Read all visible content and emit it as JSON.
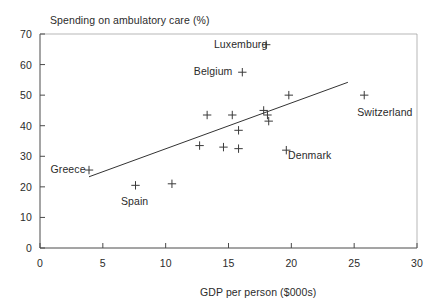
{
  "chart_data": {
    "type": "scatter",
    "title": "",
    "ylabel": "Spending on ambulatory care (%)",
    "xlabel": "GDP per person ($000s)",
    "xlim": [
      0,
      30
    ],
    "ylim": [
      0,
      70
    ],
    "xticks": [
      "0",
      "5",
      "10",
      "15",
      "20",
      "25",
      "30"
    ],
    "yticks": [
      "0",
      "10",
      "20",
      "30",
      "40",
      "50",
      "60",
      "70"
    ],
    "grid": false,
    "legend": "none",
    "marker": "plus",
    "points": [
      {
        "label": "Luxemburg",
        "x": 18.0,
        "y": 66.5
      },
      {
        "label": "Belgium",
        "x": 16.1,
        "y": 57.5
      },
      {
        "label": "",
        "x": 13.3,
        "y": 43.5
      },
      {
        "label": "",
        "x": 15.3,
        "y": 43.5
      },
      {
        "label": "",
        "x": 17.8,
        "y": 45.0
      },
      {
        "label": "",
        "x": 19.8,
        "y": 50.0
      },
      {
        "label": "Switzerland",
        "x": 25.8,
        "y": 50.0
      },
      {
        "label": "",
        "x": 18.1,
        "y": 43.5
      },
      {
        "label": "",
        "x": 18.2,
        "y": 41.5
      },
      {
        "label": "",
        "x": 15.8,
        "y": 38.5
      },
      {
        "label": "",
        "x": 12.7,
        "y": 33.5
      },
      {
        "label": "",
        "x": 14.6,
        "y": 33.0
      },
      {
        "label": "",
        "x": 15.8,
        "y": 32.5
      },
      {
        "label": "Denmark",
        "x": 19.6,
        "y": 32.0
      },
      {
        "label": "Greece",
        "x": 3.9,
        "y": 25.5
      },
      {
        "label": "",
        "x": 7.6,
        "y": 20.5
      },
      {
        "label": "",
        "x": 10.5,
        "y": 21.0
      }
    ],
    "trend_line": {
      "x0": 3.9,
      "y0": 23.3,
      "x1": 24.5,
      "y1": 54.2
    },
    "annotations": [
      {
        "name": "luxemburg",
        "text": "Luxemburg",
        "x": 14.0,
        "y": 66.5
      },
      {
        "name": "belgium",
        "text": "Belgium",
        "x": 12.4,
        "y": 57.5
      },
      {
        "name": "switzerland",
        "text": "Switzerland",
        "x": 25.4,
        "y": 44.0
      },
      {
        "name": "denmark",
        "text": "Denmark",
        "x": 19.9,
        "y": 30.0
      },
      {
        "name": "greece",
        "text": "Greece",
        "x": 1.0,
        "y": 25.5
      },
      {
        "name": "spain",
        "text": "Spain",
        "x": 6.6,
        "y": 15.0
      }
    ]
  }
}
